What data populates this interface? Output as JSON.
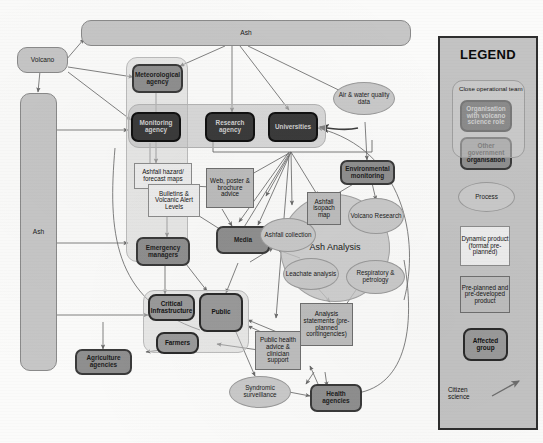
{
  "diagram": {
    "type": "flow-diagram",
    "colors": {
      "organisation_volcano_science": "#3b3b3b",
      "other_government_organisation": "#8f8f8f",
      "process": "#c9c9c9",
      "dynamic_product": "#ededed",
      "pre_planned_product": "#bdbdbd",
      "affected_group": "#9a9a9a",
      "hazard_source": "#c6c6c6",
      "close_operational_team": "#bcbcbc",
      "legend_panel": "#c3c3c3"
    }
  },
  "sources": {
    "volcano": "Volcano",
    "ash_top": "Ash",
    "ash_left": "Ash"
  },
  "organisations": {
    "meteorological_agency": "Meteorological agency",
    "monitoring_agency": "Monitoring agency",
    "research_agency": "Research agency",
    "universities": "Universities",
    "environmental_monitoring": "Environmental monitoring",
    "emergency_managers": "Emergency managers",
    "media": "Media",
    "agriculture_agencies": "Agriculture agencies",
    "health_agencies": "Health agencies"
  },
  "products": {
    "ashfall_hazard_forecast_maps": "Ashfall hazard/ forecast maps",
    "bulletins_volcanic_alert_levels": "Bulletins & Volcanic Alert Levels",
    "web_poster_brochure_advice": "Web, poster & brochure advice",
    "ashfall_isopach_map": "Ashfall isopach map",
    "analysis_statements": "Analysis statements (pre-planned contingencies)",
    "public_health_advice": "Public health advice & clinician support"
  },
  "processes": {
    "air_water_quality_data": "Air & water quality data",
    "ash_analysis": "Ash Analysis",
    "ashfall_collection": "Ashfall collection",
    "volcano_research": "Volcano Research",
    "leachate_analysis": "Leachate analysis",
    "respiratory_petrology": "Respiratory & petrology",
    "syndromic_surveillance": "Syndromic surveillance"
  },
  "affected_groups": {
    "critical_infrastructure": "Critical Infrastructure",
    "public": "Public",
    "farmers": "Farmers"
  },
  "legend": {
    "title": "LEGEND",
    "close_operational_team": "Close operational team",
    "organisation_with_volcano_science_role": "Organisation with volcano science role",
    "other_government_organisation": "Other government organisation",
    "process": "Process",
    "dynamic_product": "Dynamic product (format pre-planned)",
    "pre_planned_product": "Pre-planned and pre-developed product",
    "affected_group": "Affected group",
    "citizen_science": "Citizen science"
  }
}
